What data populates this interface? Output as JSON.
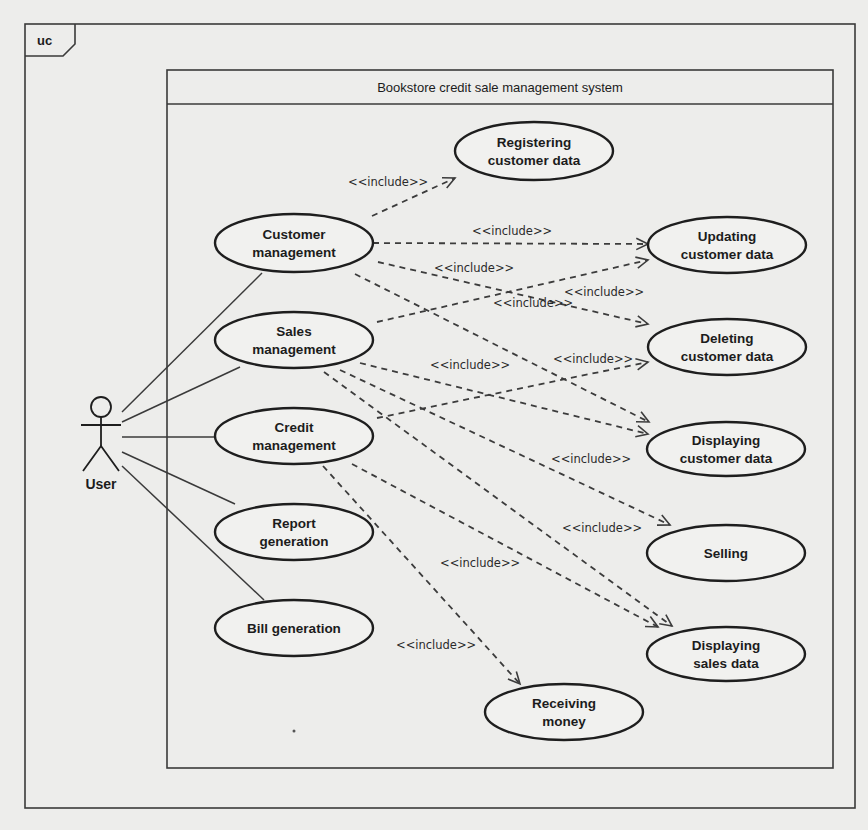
{
  "frame": {
    "tag": "uc",
    "x": 25,
    "y": 24,
    "w": 830,
    "h": 784
  },
  "system": {
    "title": "Bookstore credit sale management system",
    "x": 167,
    "y": 70,
    "w": 666,
    "h": 698,
    "title_h": 34
  },
  "actor": {
    "name": "User",
    "cx": 101,
    "head_cy": 407,
    "head_r": 10
  },
  "use_cases": [
    {
      "id": "customer_management",
      "lines": [
        "Customer",
        "management"
      ],
      "cx": 294,
      "cy": 243,
      "rx": 79,
      "ry": 29
    },
    {
      "id": "sales_management",
      "lines": [
        "Sales",
        "management"
      ],
      "cx": 294,
      "cy": 340,
      "rx": 79,
      "ry": 28
    },
    {
      "id": "credit_management",
      "lines": [
        "Credit",
        "management"
      ],
      "cx": 294,
      "cy": 436,
      "rx": 79,
      "ry": 28
    },
    {
      "id": "report_generation",
      "lines": [
        "Report",
        "generation"
      ],
      "cx": 294,
      "cy": 532,
      "rx": 79,
      "ry": 28
    },
    {
      "id": "bill_generation",
      "lines": [
        "Bill generation"
      ],
      "cx": 294,
      "cy": 628,
      "rx": 79,
      "ry": 28
    },
    {
      "id": "registering_customer_data",
      "lines": [
        "Registering",
        "customer data"
      ],
      "cx": 534,
      "cy": 151,
      "rx": 79,
      "ry": 29
    },
    {
      "id": "updating_customer_data",
      "lines": [
        "Updating",
        "customer data"
      ],
      "cx": 727,
      "cy": 245,
      "rx": 79,
      "ry": 28
    },
    {
      "id": "deleting_customer_data",
      "lines": [
        "Deleting",
        "customer data"
      ],
      "cx": 727,
      "cy": 347,
      "rx": 79,
      "ry": 28
    },
    {
      "id": "displaying_customer_data",
      "lines": [
        "Displaying",
        "customer data"
      ],
      "cx": 726,
      "cy": 449,
      "rx": 79,
      "ry": 27
    },
    {
      "id": "selling",
      "lines": [
        "Selling"
      ],
      "cx": 726,
      "cy": 553,
      "rx": 79,
      "ry": 28
    },
    {
      "id": "displaying_sales_data",
      "lines": [
        "Displaying",
        "sales data"
      ],
      "cx": 726,
      "cy": 654,
      "rx": 79,
      "ry": 27
    },
    {
      "id": "receiving_money",
      "lines": [
        "Receiving",
        "money"
      ],
      "cx": 564,
      "cy": 712,
      "rx": 79,
      "ry": 28
    }
  ],
  "associations": [
    {
      "actor": "User",
      "to": "customer_management",
      "x1": 122,
      "y1": 412,
      "x2": 262,
      "y2": 273
    },
    {
      "actor": "User",
      "to": "sales_management",
      "x1": 122,
      "y1": 422,
      "x2": 240,
      "y2": 367
    },
    {
      "actor": "User",
      "to": "credit_management",
      "x1": 122,
      "y1": 437,
      "x2": 215,
      "y2": 437
    },
    {
      "actor": "User",
      "to": "report_generation",
      "x1": 122,
      "y1": 452,
      "x2": 235,
      "y2": 504
    },
    {
      "actor": "User",
      "to": "bill_generation",
      "x1": 122,
      "y1": 466,
      "x2": 264,
      "y2": 600
    }
  ],
  "include_label": "<<include>>",
  "includes": [
    {
      "from": "customer_management",
      "to": "registering_customer_data",
      "x1": 372,
      "y1": 216,
      "x2": 455,
      "y2": 178,
      "lx": 348,
      "ly": 186
    },
    {
      "from": "customer_management",
      "to": "updating_customer_data",
      "x1": 373,
      "y1": 243,
      "x2": 648,
      "y2": 244,
      "lx": 472,
      "ly": 235
    },
    {
      "from": "customer_management",
      "to": "deleting_customer_data",
      "x1": 378,
      "y1": 262,
      "x2": 648,
      "y2": 324,
      "lx": 434,
      "ly": 272
    },
    {
      "from": "customer_management",
      "to": "displaying_customer_data",
      "x1": 355,
      "y1": 274,
      "x2": 649,
      "y2": 422,
      "lx": 493,
      "ly": 307
    },
    {
      "from": "sales_management",
      "to": "updating_customer_data",
      "x1": 377,
      "y1": 322,
      "x2": 648,
      "y2": 260,
      "lx": 564,
      "ly": 296
    },
    {
      "from": "sales_management",
      "to": "displaying_customer_data",
      "x1": 360,
      "y1": 363,
      "x2": 648,
      "y2": 434,
      "lx": 553,
      "ly": 363
    },
    {
      "from": "sales_management",
      "to": "selling",
      "x1": 340,
      "y1": 370,
      "x2": 670,
      "y2": 525,
      "lx": 551,
      "ly": 463
    },
    {
      "from": "sales_management",
      "to": "displaying_sales_data",
      "x1": 324,
      "y1": 372,
      "x2": 672,
      "y2": 626,
      "lx": 562,
      "ly": 532
    },
    {
      "from": "credit_management",
      "to": "deleting_customer_data",
      "x1": 377,
      "y1": 418,
      "x2": 648,
      "y2": 362,
      "lx": 430,
      "ly": 369
    },
    {
      "from": "credit_management",
      "to": "displaying_sales_data",
      "x1": 352,
      "y1": 464,
      "x2": 658,
      "y2": 627,
      "lx": 440,
      "ly": 567
    },
    {
      "from": "credit_management",
      "to": "receiving_money",
      "x1": 323,
      "y1": 466,
      "x2": 520,
      "y2": 684,
      "lx": 396,
      "ly": 649
    }
  ],
  "decorations": {
    "stray_dot": {
      "x": 294,
      "y": 731
    }
  }
}
